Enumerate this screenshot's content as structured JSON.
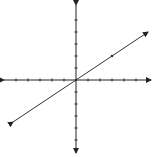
{
  "chart_data": {
    "type": "line",
    "title": "",
    "xlabel": "",
    "ylabel": "",
    "xlim": [
      -6,
      6
    ],
    "ylim": [
      -6,
      6
    ],
    "x_ticks": [
      -5,
      -4,
      -3,
      -2,
      -1,
      1,
      2,
      3,
      4,
      5
    ],
    "y_ticks": [
      -5,
      -4,
      -3,
      -2,
      -1,
      1,
      2,
      3,
      4,
      5
    ],
    "grid": false,
    "axes_arrows": true,
    "series": [
      {
        "name": "line",
        "equation": "y = (2/3)x",
        "slope": 0.6667,
        "intercept": 0,
        "x": [
          -5.25,
          6
        ],
        "y": [
          -3.5,
          4
        ],
        "arrows_both_ends": true,
        "marked_points": [
          {
            "x": 0,
            "y": 0
          },
          {
            "x": 3,
            "y": 2
          }
        ]
      }
    ],
    "colors": {
      "axis": "#222222",
      "line": "#333333"
    }
  }
}
